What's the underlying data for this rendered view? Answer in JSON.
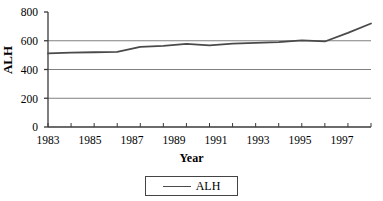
{
  "chart_data": {
    "type": "line",
    "title": "",
    "xlabel": "Year",
    "ylabel": "ALH",
    "x": [
      1983,
      1984,
      1985,
      1986,
      1987,
      1988,
      1989,
      1990,
      1991,
      1992,
      1993,
      1994,
      1995,
      1996,
      1997
    ],
    "series": [
      {
        "name": "ALH",
        "values": [
          512,
          518,
          520,
          522,
          558,
          565,
          578,
          568,
          580,
          585,
          590,
          602,
          595,
          655,
          720
        ],
        "color": "#4a4a4a"
      }
    ],
    "xlim": [
      1983,
      1997
    ],
    "ylim": [
      0,
      800
    ],
    "yticks": [
      0,
      200,
      400,
      600,
      800
    ],
    "ytick_labels": [
      "0",
      "200",
      "400",
      "600",
      "800"
    ],
    "xticks": [
      1983,
      1984,
      1985,
      1986,
      1987,
      1988,
      1989,
      1990,
      1991,
      1992,
      1993,
      1994,
      1995,
      1996,
      1997
    ],
    "xtick_labels_shown": [
      "1983",
      "1985",
      "1987",
      "1989",
      "1991",
      "1993",
      "1995",
      "1997"
    ],
    "grid": "horizontal",
    "grid_color": "#808080",
    "legend": {
      "position": "bottom-center",
      "entries": [
        "ALH"
      ]
    },
    "axis_color": "#3a3a3a",
    "background": "#ffffff"
  }
}
